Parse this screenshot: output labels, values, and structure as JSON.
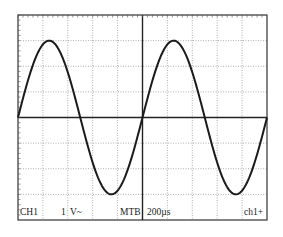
{
  "display": {
    "channel_label": "CH1",
    "volts_per_div": "1",
    "coupling": "V~",
    "timebase_label": "MTB",
    "time_per_div": "200µs",
    "trigger": "ch1+"
  },
  "grid": {
    "divisions_x": 10,
    "divisions_y": 8,
    "line_color": "#9a9a9a",
    "border_color": "#333333",
    "trace_color": "#1a1a1a"
  },
  "chart_data": {
    "type": "line",
    "title": "",
    "xlabel": "time (200µs/div)",
    "ylabel": "CH1 (1 V/div)",
    "xlim": [
      -5,
      5
    ],
    "ylim": [
      -4,
      4
    ],
    "grid": true,
    "series": [
      {
        "name": "CH1",
        "function": "sine",
        "amplitude_div": 3,
        "period_div": 5,
        "phase": "zero-crossing rising at x=0 (center)",
        "amplitude_V": 3,
        "period_us": 1000,
        "frequency_Hz": 1000
      }
    ]
  }
}
